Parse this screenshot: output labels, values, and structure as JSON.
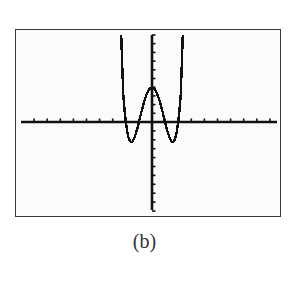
{
  "figure": {
    "caption": "(b)"
  },
  "chart_data": {
    "type": "line",
    "title": "",
    "caption": "(b)",
    "function": "f(x) = x^4 - 5x^2 + 4",
    "xlabel": "",
    "ylabel": "",
    "xlim": [
      -10,
      10
    ],
    "ylim": [
      -10,
      10
    ],
    "xscale_tick": 1,
    "yscale_tick": 1,
    "grid": false,
    "legend": null,
    "x_intercepts": [
      -2,
      -1,
      1,
      2
    ],
    "y_intercept": 4,
    "local_minima": [
      {
        "x": -1.58,
        "y": -2.25
      },
      {
        "x": 1.58,
        "y": -2.25
      }
    ],
    "local_maximum": {
      "x": 0,
      "y": 4
    },
    "series": [
      {
        "name": "f",
        "x": [
          -2.35,
          -2.2,
          -2.1,
          -2.0,
          -1.9,
          -1.8,
          -1.7,
          -1.58,
          -1.5,
          -1.4,
          -1.3,
          -1.2,
          -1.1,
          -1.0,
          -0.8,
          -0.6,
          -0.4,
          -0.2,
          0.0,
          0.2,
          0.4,
          0.6,
          0.8,
          1.0,
          1.1,
          1.2,
          1.3,
          1.4,
          1.5,
          1.58,
          1.7,
          1.8,
          1.9,
          2.0,
          2.1,
          2.2,
          2.35
        ],
        "y": [
          10.89,
          3.22,
          1.4,
          0.0,
          -0.98,
          -1.7,
          -2.1,
          -2.25,
          -2.19,
          -1.96,
          -1.59,
          -1.13,
          -0.59,
          0.0,
          1.21,
          2.33,
          3.23,
          3.8,
          4.0,
          3.8,
          3.23,
          2.33,
          1.21,
          0.0,
          -0.59,
          -1.13,
          -1.59,
          -1.96,
          -2.19,
          -2.25,
          -2.1,
          -1.7,
          -0.98,
          0.0,
          1.4,
          3.22,
          10.89
        ]
      }
    ],
    "colors": {
      "line": "#111111",
      "axes": "#111111",
      "frame": "#3a3a3a",
      "background": "#fbfbfb"
    }
  }
}
